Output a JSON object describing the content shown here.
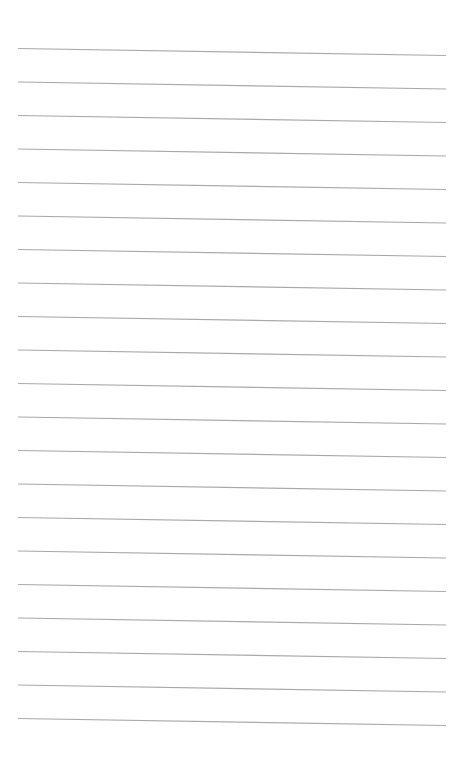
{
  "page": {
    "type": "lined-paper",
    "background": "#ffffff",
    "line_color": "#a9a9a9",
    "line_count": 21,
    "line_thickness": 1.2,
    "left_x": 18,
    "right_x": 446,
    "first_line_left_y": 48.5,
    "first_line_right_y": 55.5,
    "line_spacing": 33.5,
    "text": []
  }
}
